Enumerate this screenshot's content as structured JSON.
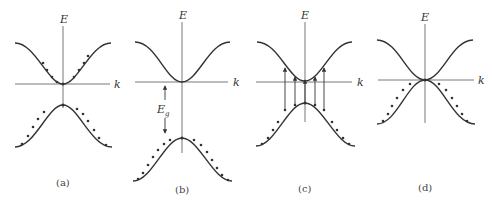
{
  "figure": {
    "axis_labels": {
      "energy": "E",
      "wavevector": "k",
      "gap": "E",
      "gap_subscript": "g"
    },
    "panels": [
      {
        "id": "a",
        "caption": "(a)",
        "description": "Upper band partially filled near minimum; lower band partially filled near maximum (semi-metal / small gap)"
      },
      {
        "id": "b",
        "caption": "(b)",
        "description": "Band gap Eg between conduction band minimum and valence band maximum; valence band filled"
      },
      {
        "id": "c",
        "caption": "(c)",
        "description": "Vertical arrows showing excitations from valence band to conduction band"
      },
      {
        "id": "d",
        "caption": "(d)",
        "description": "Conduction and valence bands touching at k = 0 (zero gap)"
      }
    ]
  },
  "colors": {
    "curve": "#333333",
    "axis": "#555555",
    "background": "#ffffff"
  }
}
